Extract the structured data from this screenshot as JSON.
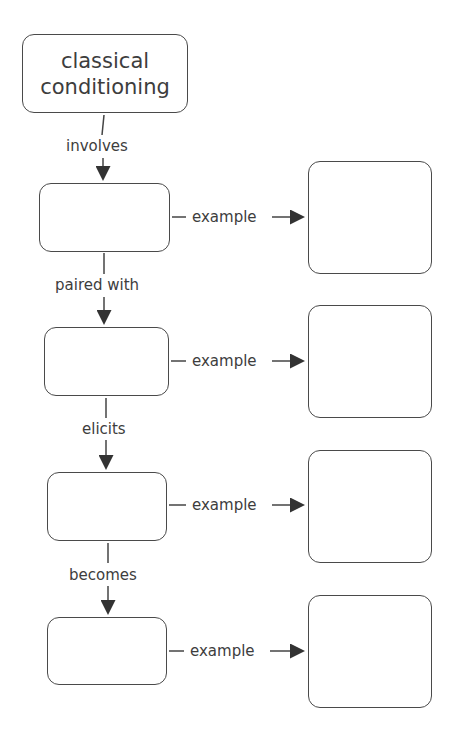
{
  "diagram": {
    "title_node": {
      "line1": "classical",
      "line2": "conditioning"
    },
    "links": [
      {
        "label": "involves"
      },
      {
        "label": "paired with"
      },
      {
        "label": "elicits"
      },
      {
        "label": "becomes"
      }
    ],
    "example_label": "example",
    "nodes": [
      {
        "text": ""
      },
      {
        "text": ""
      },
      {
        "text": ""
      },
      {
        "text": ""
      }
    ],
    "example_nodes": [
      {
        "text": ""
      },
      {
        "text": ""
      },
      {
        "text": ""
      },
      {
        "text": ""
      }
    ]
  }
}
